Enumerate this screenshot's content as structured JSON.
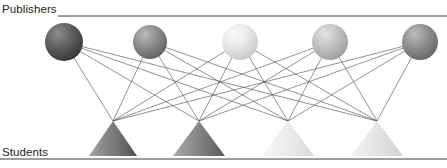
{
  "figure": {
    "title_top": "Publishers",
    "title_bottom": "Students",
    "partial_top_glyph": "",
    "background_color": "#ffffff",
    "rule_color": "#3a3a3a",
    "edge_color": "#4a4a4a"
  },
  "chart_data": {
    "type": "diagram",
    "diagram_type": "bipartite-graph",
    "title": "",
    "layers": [
      {
        "name": "Publishers",
        "label": "Publishers",
        "node_shape": "sphere",
        "count": 5,
        "nodes": [
          {
            "id": "P1",
            "cx": 64,
            "cy": 42,
            "r": 19,
            "fill": "#5e5e5e",
            "highlight": "#8e8e8e",
            "shade": "#3e3e3e"
          },
          {
            "id": "P2",
            "cx": 150,
            "cy": 42,
            "r": 17,
            "fill": "#8a8a8a",
            "highlight": "#b4b4b4",
            "shade": "#6a6a6a"
          },
          {
            "id": "P3",
            "cx": 240,
            "cy": 42,
            "r": 18,
            "fill": "#e6e6e6",
            "highlight": "#f7f7f7",
            "shade": "#cfcfcf"
          },
          {
            "id": "P4",
            "cx": 330,
            "cy": 42,
            "r": 18,
            "fill": "#c2c2c2",
            "highlight": "#e0e0e0",
            "shade": "#a6a6a6"
          },
          {
            "id": "P5",
            "cx": 420,
            "cy": 42,
            "r": 18,
            "fill": "#8d8d8d",
            "highlight": "#b6b6b6",
            "shade": "#6d6d6d"
          }
        ]
      },
      {
        "name": "Students",
        "label": "Students",
        "node_shape": "triangle",
        "count": 4,
        "nodes": [
          {
            "id": "S1",
            "apex_x": 113,
            "apex_y": 121,
            "half_width": 24,
            "base_y": 156,
            "fill_left": "#9a9a9a",
            "fill_right": "#5a5a5a"
          },
          {
            "id": "S2",
            "apex_x": 199,
            "apex_y": 121,
            "half_width": 26,
            "base_y": 156,
            "fill_left": "#a8a8a8",
            "fill_right": "#646464"
          },
          {
            "id": "S3",
            "apex_x": 288,
            "apex_y": 121,
            "half_width": 26,
            "base_y": 156,
            "fill_left": "#f2f2f2",
            "fill_right": "#dcdcdc"
          },
          {
            "id": "S4",
            "apex_x": 377,
            "apex_y": 121,
            "half_width": 26,
            "base_y": 156,
            "fill_left": "#ededed",
            "fill_right": "#d4d4d4"
          }
        ]
      }
    ],
    "edges": [
      {
        "from": "P1",
        "to": "S1"
      },
      {
        "from": "P1",
        "to": "S2"
      },
      {
        "from": "P1",
        "to": "S3"
      },
      {
        "from": "P1",
        "to": "S4"
      },
      {
        "from": "P2",
        "to": "S1"
      },
      {
        "from": "P2",
        "to": "S2"
      },
      {
        "from": "P2",
        "to": "S3"
      },
      {
        "from": "P2",
        "to": "S4"
      },
      {
        "from": "P3",
        "to": "S1"
      },
      {
        "from": "P3",
        "to": "S2"
      },
      {
        "from": "P3",
        "to": "S3"
      },
      {
        "from": "P3",
        "to": "S4"
      },
      {
        "from": "P4",
        "to": "S1"
      },
      {
        "from": "P4",
        "to": "S2"
      },
      {
        "from": "P4",
        "to": "S3"
      },
      {
        "from": "P4",
        "to": "S4"
      },
      {
        "from": "P5",
        "to": "S1"
      },
      {
        "from": "P5",
        "to": "S2"
      },
      {
        "from": "P5",
        "to": "S3"
      },
      {
        "from": "P5",
        "to": "S4"
      }
    ],
    "edge_count": 20,
    "rules": [
      {
        "id": "top-rule",
        "x1": 58,
        "x2": 447,
        "y": 16
      },
      {
        "id": "bottom-rule",
        "x1": 0,
        "x2": 447,
        "y": 159
      }
    ]
  }
}
